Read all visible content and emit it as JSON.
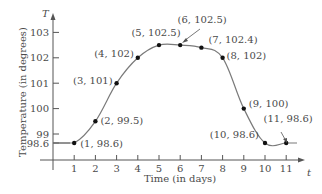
{
  "chart_data": {
    "type": "line",
    "title": "",
    "xlabel": "Time (in days)",
    "ylabel": "Temperature (in degrees)",
    "x_axis_var": "t",
    "y_axis_var": "T",
    "x_ticks": [
      "1",
      "2",
      "3",
      "4",
      "5",
      "6",
      "7",
      "8",
      "9",
      "10",
      "11"
    ],
    "y_ticks": [
      "98.6",
      "99",
      "100",
      "101",
      "102",
      "103"
    ],
    "xlim": [
      0,
      11.5
    ],
    "ylim": [
      98.6,
      103.2
    ],
    "grid": false,
    "legend": "none",
    "points": [
      {
        "x": 1,
        "y": 98.6,
        "label": "(1, 98.6)"
      },
      {
        "x": 2,
        "y": 99.5,
        "label": "(2, 99.5)"
      },
      {
        "x": 3,
        "y": 101,
        "label": "(3, 101)"
      },
      {
        "x": 4,
        "y": 102,
        "label": "(4, 102)"
      },
      {
        "x": 5,
        "y": 102.5,
        "label": "(5, 102.5)"
      },
      {
        "x": 6,
        "y": 102.5,
        "label": "(6, 102.5)"
      },
      {
        "x": 7,
        "y": 102.4,
        "label": "(7, 102.4)"
      },
      {
        "x": 8,
        "y": 102,
        "label": "(8, 102)"
      },
      {
        "x": 9,
        "y": 100,
        "label": "(9, 100)"
      },
      {
        "x": 10,
        "y": 98.6,
        "label": "(10, 98.6)"
      },
      {
        "x": 11,
        "y": 98.6,
        "label": "(11, 98.6)"
      }
    ],
    "colors": {
      "curve": "#7a7a7a",
      "axis": "#555555",
      "point": "#111111",
      "text": "#4a4a4a"
    }
  }
}
